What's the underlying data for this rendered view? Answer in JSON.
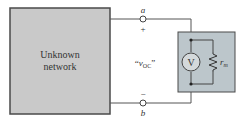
{
  "diagram": {
    "network_box": {
      "label_line1": "Unknown",
      "label_line2": "network",
      "fill": "#c9c9c9",
      "stroke": "#4a4a4a"
    },
    "terminals": {
      "a": {
        "label": "a",
        "polarity": "+"
      },
      "b": {
        "label": "b",
        "polarity": "−"
      }
    },
    "voltage_label": {
      "open_quote": "“",
      "symbol": "v",
      "subscript": "OC",
      "close_quote": "”"
    },
    "meter_box": {
      "fill": "#bcc6cb",
      "stroke": "#4a4a4a",
      "voltmeter_label": "V",
      "resistor_label": "r",
      "resistor_subscript": "m"
    },
    "wire_color": "#555555"
  }
}
